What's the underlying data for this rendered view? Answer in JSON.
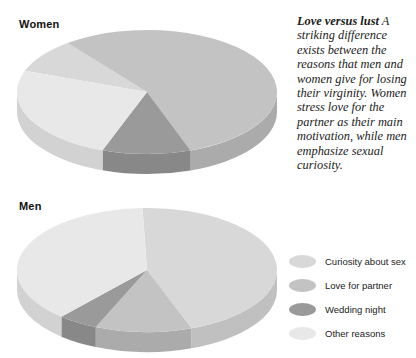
{
  "caption": {
    "lead": "Love versus lust",
    "body": " A striking difference exists between the reasons that men and women give for losing their virginity. Women stress love for the partner as their main motivation, while men emphasize sexual curiosity."
  },
  "colors": {
    "curiosity": "#d8d8d8",
    "love": "#c3c3c3",
    "wedding": "#9a9a9a",
    "other": "#e8e8e8",
    "curiosity_side": "#c0c0c0",
    "love_side": "#ababab",
    "wedding_side": "#888888",
    "other_side": "#d2d2d2"
  },
  "legend": {
    "items": [
      {
        "label": "Curiosity about sex",
        "key": "curiosity"
      },
      {
        "label": "Love for partner",
        "key": "love"
      },
      {
        "label": "Wedding night",
        "key": "wedding"
      },
      {
        "label": "Other reasons",
        "key": "other"
      }
    ]
  },
  "chart_data": {
    "type": "pie",
    "title": "Love versus lust",
    "note": "Reasons given for losing virginity, by sex. Two 3-D pie charts.",
    "categories": [
      "Curiosity about sex",
      "Love for partner",
      "Wedding night",
      "Other reasons"
    ],
    "legend_position": "bottom-right",
    "charts": [
      {
        "name": "Women",
        "label": "Women",
        "values": [
          9,
          55,
          11,
          25
        ],
        "unit": "percent"
      },
      {
        "name": "Men",
        "label": "Men",
        "values": [
          45,
          12,
          5,
          38
        ],
        "unit": "percent"
      }
    ]
  }
}
